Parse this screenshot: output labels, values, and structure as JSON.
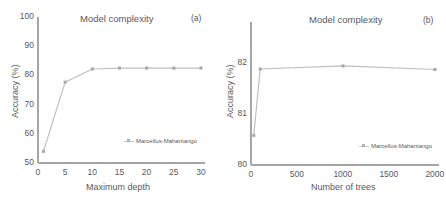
{
  "chart_data": [
    {
      "type": "line",
      "panel_label": "(a)",
      "title": "Model complexity",
      "xlabel": "Maximum depth",
      "ylabel": "Accuracy (%)",
      "xlim": [
        0,
        30
      ],
      "ylim": [
        50,
        100
      ],
      "xticks": [
        "0",
        "5",
        "10",
        "15",
        "20",
        "25",
        "30"
      ],
      "yticks": [
        "50",
        "60",
        "70",
        "80",
        "90",
        "100"
      ],
      "grid": false,
      "legend_position": "lower right",
      "series": [
        {
          "name": "Marcellus-Mahantango",
          "x": [
            1,
            5,
            10,
            15,
            20,
            25,
            30
          ],
          "values": [
            54,
            77.7,
            82.2,
            82.5,
            82.5,
            82.5,
            82.5
          ],
          "color": "#bfbfbf"
        }
      ]
    },
    {
      "type": "line",
      "panel_label": "(b)",
      "title": "Model complexity",
      "xlabel": "Number of trees",
      "ylabel": "Accuracy (%)",
      "xlim": [
        0,
        2000
      ],
      "ylim": [
        80,
        82.8
      ],
      "xticks": [
        "0",
        "500",
        "1000",
        "1500",
        "2000"
      ],
      "yticks": [
        "80",
        "81",
        "82"
      ],
      "grid": false,
      "legend_position": "lower right",
      "series": [
        {
          "name": "Marcellus-Mahantango",
          "x": [
            30,
            100,
            1000,
            2000
          ],
          "values": [
            80.58,
            81.88,
            81.94,
            81.87
          ],
          "color": "#bfbfbf"
        }
      ]
    }
  ],
  "colors": {
    "axis": "#a6a6a6",
    "series": "#bfbfbf",
    "marker": "#a6a6a6",
    "text": "#595959"
  }
}
